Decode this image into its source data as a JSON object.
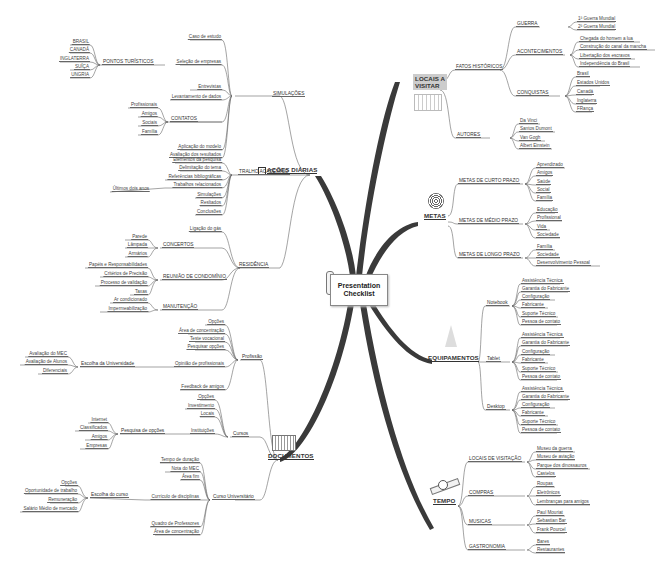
{
  "central": {
    "title": "Presentation Checklist",
    "line1": "Presentation",
    "line2": "Checklist"
  },
  "colors": {
    "trunk": "#3a3a3a",
    "line": "#666666",
    "text": "#444444",
    "locais_bg": "#cccccc"
  },
  "branches": {
    "acoes": {
      "label": "AÇÕES DIÁRIAS",
      "icon": "checkbox-icon",
      "children": {
        "simulacoes": {
          "label": "SIMULAÇÕES",
          "items": [
            "Caso de estudo",
            "Seleção de empresas",
            "Entrevistas",
            "Levantamento de dados",
            "Aplicação do modelo",
            "Avaliação dos resultados"
          ]
        },
        "pontos": {
          "label": "PONTOS TURÍSTICOS",
          "items": [
            "BRASIL",
            "CANADÁ",
            "INGLATERRA",
            "SUÍÇA",
            "UNGRIA"
          ]
        },
        "contatos": {
          "label": "CONTATOS",
          "items": [
            "Profissionais",
            "Amigos",
            "Sociais",
            "Família"
          ]
        },
        "trabalho": {
          "label": "TRALHO ACADÊMICO",
          "items": [
            "Elementos da pesquisa",
            "Delimitação do tema",
            "Referências bibliográficas",
            "Trabalhos relacionados",
            "Simulações",
            "Resltados",
            "Conclusões"
          ],
          "sub": "Últimos dois anos"
        },
        "residencia": {
          "label": "RESIDÊNCIA",
          "items": [
            "Ligação do gás"
          ]
        },
        "concertos": {
          "label": "CONCERTOS",
          "items": [
            "Parede",
            "Lâmpada",
            "Armários"
          ]
        },
        "reuniao": {
          "label": "REUNIÃO DE CONDOMÍNIO",
          "items": [
            "Papéis e Responsabilidades",
            "Critérios de Precisão",
            "Processo de validação",
            "Taxas"
          ]
        },
        "manutencao": {
          "label": "MANUTENÇÃO",
          "items": [
            "Ar condicionado",
            "Impermeabilização"
          ]
        }
      }
    },
    "documentos": {
      "label": "DOCUMENTOS",
      "icon": "folders-icon",
      "children": {
        "profissao": {
          "label": "Profissão",
          "items": [
            "Opções",
            "Área de concentração",
            "Teste vocacional",
            "Pesquisar opções",
            "Opinião de profissionais",
            "Feedback de amigos"
          ]
        },
        "escolha_univ": {
          "label": "Escolha da Universidade",
          "items": [
            "Avaliação do MEC",
            "Avaliação de Alunos",
            "Diferenciais"
          ]
        },
        "cursos": {
          "label": "Cursos",
          "items": [
            "Opções",
            "Investimento",
            "Locais",
            "Instituições"
          ]
        },
        "pesquisa": {
          "label": "Pesquisa de opções",
          "items": [
            "Internet",
            "Classificados",
            "Amigos",
            "Empresas"
          ]
        },
        "curso_univ": {
          "label": "Curso Universitário",
          "items": [
            "Tempo de duração",
            "Nota do MEC",
            "Área fim",
            "Currículo de disciplinas",
            "Quadro de Professores",
            "Área de concentração"
          ]
        },
        "escolha_curso": {
          "label": "Escolha do curso",
          "items": [
            "Opções",
            "Oportunidade de trabalho",
            "Remuneração",
            "Salário Médio de mercado"
          ]
        }
      }
    },
    "locais": {
      "label_line1": "LOCAIS A",
      "label_line2": "VISITAR",
      "icon": "building-icon",
      "children": {
        "fatos": {
          "label": "FATOS HISTÓRICOS"
        },
        "guerra": {
          "label": "GUERRA",
          "items": [
            "1ª Guerra Mundial",
            "2ª Guerra Mundial"
          ]
        },
        "acontecimentos": {
          "label": "ACONTECIMENTOS",
          "items": [
            "Chegada do homem a lua",
            "Construção do canal da mancha",
            "Libertação dos escravos",
            "Independência do Brasil"
          ]
        },
        "conquistas": {
          "label": "CONQUISTAS",
          "items": [
            "Brasil",
            "Estados Unidos",
            "Canadá",
            "Inglaterra",
            "FRança"
          ]
        },
        "autores": {
          "label": "AUTORES",
          "items": [
            "Da Vinci",
            "Santos Dumont",
            "Van Gogh",
            "Albert Einstein"
          ]
        }
      }
    },
    "metas": {
      "label": "METAS",
      "icon": "target-icon",
      "children": {
        "curto": {
          "label": "METAS DE CURTO PRAZO",
          "items": [
            "Aprendizado",
            "Amigos",
            "Saúde",
            "Social",
            "Família"
          ]
        },
        "medio": {
          "label": "METAS DE MÉDIO PRAZO",
          "items": [
            "Educação",
            "Profissional",
            "Vida",
            "Sociedade"
          ]
        },
        "longo": {
          "label": "METAS DE LONGO PRAZO",
          "items": [
            "Família",
            "Sociedade",
            "Desenvolvimento Pessoal"
          ]
        }
      }
    },
    "equipamentos": {
      "label": "EQUIPAMENTOS",
      "icon": "cone-icon",
      "children": {
        "notebook": {
          "label": "Notebook",
          "items": [
            "Assistência Técnica",
            "Garantia do Fabricante",
            "Configuração",
            "Fabricante",
            "Suporte Técnico",
            "Pessoa de contato"
          ]
        },
        "tablet": {
          "label": "Tablet",
          "items": [
            "Assistência Técnica",
            "Garantia do Fabricante",
            "Configuração",
            "Fabricante",
            "Suporte Técnico",
            "Pessoa de contato"
          ]
        },
        "desktop": {
          "label": "Desktop",
          "items": [
            "Assistência Técnica",
            "Garantia do Fabricante",
            "Configuração",
            "Fabricante",
            "Suporte Técnico",
            "Pessoa de contato"
          ]
        }
      }
    },
    "tempo": {
      "label": "TEMPO",
      "icon": "satellite-clock-icon",
      "children": {
        "locais_visitacao": {
          "label": "LOCAIS DE VISITAÇÃO",
          "items": [
            "Museu da guerra",
            "Museu de aviação",
            "Parque dos dinossauros",
            "Castelos"
          ]
        },
        "compras": {
          "label": "COMPRAS",
          "items": [
            "Roupas",
            "Eletrônicos",
            "Lembranças para amigos"
          ]
        },
        "musicas": {
          "label": "MUSICAS",
          "items": [
            "Paul Mouriat",
            "Sebastian Bar",
            "Frank Pourcel"
          ]
        },
        "gastronomia": {
          "label": "GASTRONOMIA",
          "items": [
            "Bares",
            "Restaurantes"
          ]
        }
      }
    }
  }
}
